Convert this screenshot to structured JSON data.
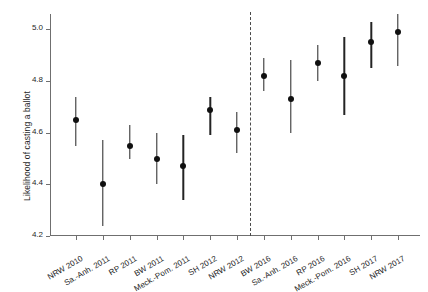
{
  "chart_data": {
    "type": "scatter",
    "title": "",
    "xlabel": "",
    "ylabel": "Likelihood of casting a ballot",
    "ylim": [
      4.2,
      5.06
    ],
    "yticks": [
      4.2,
      4.4,
      4.6,
      4.8,
      5.0
    ],
    "ytick_labels": [
      "4.2",
      "4.4",
      "4.6",
      "4.8",
      "5.0"
    ],
    "grid": false,
    "legend": "none",
    "annotations": [
      {
        "name": "group-divider",
        "type": "vertical-dashed-line",
        "between": [
          "NRW 2012",
          "BW 2016"
        ]
      }
    ],
    "categories": [
      "NRW 2010",
      "Sa.-Anh. 2011",
      "RP 2011",
      "BW 2011",
      "Meck.-Pom. 2011",
      "SH 2012",
      "NRW 2012",
      "BW 2016",
      "Sa.-Anh. 2016",
      "RP 2016",
      "Meck.-Pom. 2016",
      "SH 2017",
      "NRW 2017"
    ],
    "values": [
      4.65,
      4.4,
      4.55,
      4.5,
      4.47,
      4.69,
      4.61,
      4.82,
      4.73,
      4.87,
      4.82,
      4.95,
      4.99
    ],
    "ci_low": [
      4.55,
      4.24,
      4.5,
      4.4,
      4.34,
      4.59,
      4.52,
      4.76,
      4.6,
      4.8,
      4.67,
      4.85,
      4.86
    ],
    "ci_high": [
      4.74,
      4.57,
      4.63,
      4.6,
      4.59,
      4.74,
      4.68,
      4.89,
      4.88,
      4.94,
      4.97,
      5.03,
      5.06
    ]
  }
}
